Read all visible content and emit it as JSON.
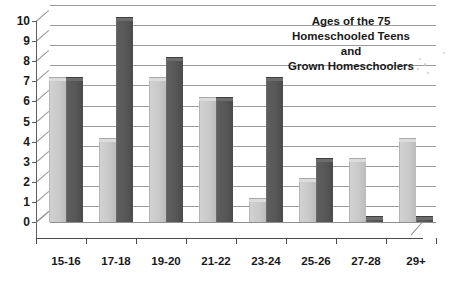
{
  "chart_data": {
    "type": "bar",
    "title_lines": [
      "Ages of the 75",
      "Homeschooled Teens",
      "and",
      "Grown Homeschoolers"
    ],
    "categories": [
      "15-16",
      "17-18",
      "19-20",
      "21-22",
      "23-24",
      "25-26",
      "27-28",
      "29+"
    ],
    "series": [
      {
        "name": "Series 1",
        "color": "#c9c9c9",
        "values": [
          7,
          4,
          7,
          6,
          1,
          2,
          3,
          4
        ]
      },
      {
        "name": "Series 2",
        "color": "#575757",
        "values": [
          7,
          10,
          8,
          6,
          7,
          3,
          0,
          0
        ]
      }
    ],
    "y_ticks": [
      0,
      1,
      2,
      3,
      4,
      5,
      6,
      7,
      8,
      9,
      10
    ],
    "ylim": [
      0,
      10
    ],
    "xlabel": "",
    "ylabel": "",
    "grid": true,
    "legend": "none",
    "style": "3d-clustered-column"
  }
}
